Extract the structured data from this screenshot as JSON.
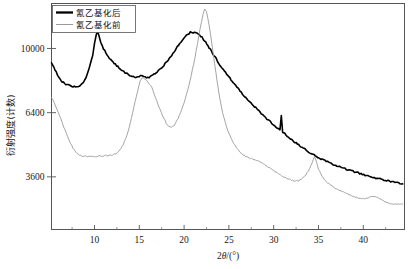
{
  "chart_data": {
    "type": "line",
    "title": "",
    "xlabel": "2θ/(°)",
    "ylabel": "衍射强度(计数)",
    "xlim": [
      5.2,
      44.6
    ],
    "ylim": [
      1900,
      13000
    ],
    "yscale": "sqrt",
    "grid": false,
    "legend_position": "top-left",
    "xticks": [
      10,
      15,
      20,
      25,
      30,
      35,
      40
    ],
    "xtick_labels": [
      "10",
      "15",
      "20",
      "25",
      "30",
      "35",
      "40"
    ],
    "xminorticks": [
      7.5,
      12.5,
      17.5,
      22.5,
      27.5,
      32.5,
      37.5,
      42.5
    ],
    "yticks": [
      10000,
      6400,
      3600
    ],
    "ytick_labels": [
      "10000",
      "6400",
      "3600"
    ],
    "series": [
      {
        "name": "氰乙基化后",
        "color": "#000000",
        "linewidth": 1.6,
        "points": [
          [
            5.2,
            9100
          ],
          [
            5.6,
            8700
          ],
          [
            6.0,
            8300
          ],
          [
            6.4,
            8050
          ],
          [
            6.8,
            7900
          ],
          [
            7.2,
            7820
          ],
          [
            7.6,
            7780
          ],
          [
            8.0,
            7760
          ],
          [
            8.3,
            7800
          ],
          [
            8.6,
            7900
          ],
          [
            8.9,
            8100
          ],
          [
            9.2,
            8450
          ],
          [
            9.5,
            8950
          ],
          [
            9.8,
            9600
          ],
          [
            10.0,
            10300
          ],
          [
            10.2,
            10850
          ],
          [
            10.35,
            11050
          ],
          [
            10.5,
            10800
          ],
          [
            10.7,
            10400
          ],
          [
            11.0,
            10000
          ],
          [
            11.4,
            9620
          ],
          [
            11.8,
            9330
          ],
          [
            12.2,
            9100
          ],
          [
            12.6,
            8900
          ],
          [
            13.0,
            8720
          ],
          [
            13.4,
            8560
          ],
          [
            13.8,
            8420
          ],
          [
            14.2,
            8320
          ],
          [
            14.6,
            8270
          ],
          [
            15.0,
            8290
          ],
          [
            15.25,
            8400
          ],
          [
            15.5,
            8340
          ],
          [
            15.8,
            8270
          ],
          [
            16.1,
            8290
          ],
          [
            16.5,
            8400
          ],
          [
            17.0,
            8600
          ],
          [
            17.5,
            8850
          ],
          [
            18.0,
            9150
          ],
          [
            18.5,
            9500
          ],
          [
            19.0,
            9900
          ],
          [
            19.5,
            10300
          ],
          [
            20.0,
            10650
          ],
          [
            20.4,
            10900
          ],
          [
            20.7,
            11030
          ],
          [
            21.0,
            10980
          ],
          [
            21.3,
            11020
          ],
          [
            21.6,
            10900
          ],
          [
            22.0,
            10700
          ],
          [
            22.4,
            10400
          ],
          [
            22.8,
            10050
          ],
          [
            23.2,
            9700
          ],
          [
            23.6,
            9350
          ],
          [
            24.0,
            9000
          ],
          [
            24.5,
            8650
          ],
          [
            25.0,
            8300
          ],
          [
            25.5,
            7980
          ],
          [
            26.0,
            7680
          ],
          [
            26.5,
            7380
          ],
          [
            27.0,
            7120
          ],
          [
            27.5,
            6880
          ],
          [
            28.0,
            6650
          ],
          [
            28.5,
            6420
          ],
          [
            29.0,
            6200
          ],
          [
            29.5,
            6000
          ],
          [
            30.0,
            5800
          ],
          [
            30.4,
            5650
          ],
          [
            30.7,
            5560
          ],
          [
            30.85,
            6250
          ],
          [
            31.0,
            5480
          ],
          [
            31.4,
            5320
          ],
          [
            31.9,
            5150
          ],
          [
            32.4,
            5000
          ],
          [
            32.9,
            4860
          ],
          [
            33.4,
            4720
          ],
          [
            33.9,
            4600
          ],
          [
            34.4,
            4480
          ],
          [
            34.9,
            4380
          ],
          [
            35.4,
            4280
          ],
          [
            36.0,
            4180
          ],
          [
            36.6,
            4090
          ],
          [
            37.2,
            4000
          ],
          [
            37.8,
            3930
          ],
          [
            38.4,
            3860
          ],
          [
            39.0,
            3790
          ],
          [
            39.6,
            3730
          ],
          [
            40.2,
            3670
          ],
          [
            40.8,
            3610
          ],
          [
            41.4,
            3560
          ],
          [
            42.0,
            3510
          ],
          [
            42.6,
            3460
          ],
          [
            43.2,
            3420
          ],
          [
            43.8,
            3380
          ],
          [
            44.4,
            3340
          ]
        ]
      },
      {
        "name": "氰乙基化前",
        "color": "#9a9a9a",
        "linewidth": 0.9,
        "points": [
          [
            5.2,
            7200
          ],
          [
            5.5,
            6900
          ],
          [
            5.8,
            6600
          ],
          [
            6.1,
            6250
          ],
          [
            6.4,
            5900
          ],
          [
            6.7,
            5560
          ],
          [
            7.0,
            5250
          ],
          [
            7.3,
            4980
          ],
          [
            7.6,
            4760
          ],
          [
            7.9,
            4600
          ],
          [
            8.2,
            4490
          ],
          [
            8.6,
            4430
          ],
          [
            9.0,
            4410
          ],
          [
            9.5,
            4400
          ],
          [
            10.0,
            4400
          ],
          [
            10.5,
            4410
          ],
          [
            11.0,
            4430
          ],
          [
            11.5,
            4450
          ],
          [
            12.0,
            4470
          ],
          [
            12.4,
            4520
          ],
          [
            12.8,
            4650
          ],
          [
            13.2,
            4900
          ],
          [
            13.6,
            5300
          ],
          [
            14.0,
            5900
          ],
          [
            14.4,
            6700
          ],
          [
            14.8,
            7500
          ],
          [
            15.1,
            8050
          ],
          [
            15.3,
            8250
          ],
          [
            15.6,
            8200
          ],
          [
            16.0,
            8000
          ],
          [
            16.4,
            7700
          ],
          [
            16.8,
            7200
          ],
          [
            17.2,
            6700
          ],
          [
            17.6,
            6250
          ],
          [
            18.0,
            5900
          ],
          [
            18.3,
            5720
          ],
          [
            18.6,
            5680
          ],
          [
            18.9,
            5780
          ],
          [
            19.2,
            6000
          ],
          [
            19.6,
            6400
          ],
          [
            20.0,
            6900
          ],
          [
            20.4,
            7550
          ],
          [
            20.8,
            8400
          ],
          [
            21.2,
            9400
          ],
          [
            21.5,
            10300
          ],
          [
            21.8,
            11300
          ],
          [
            22.1,
            12200
          ],
          [
            22.3,
            12650
          ],
          [
            22.5,
            12450
          ],
          [
            22.8,
            11500
          ],
          [
            23.1,
            10300
          ],
          [
            23.4,
            9100
          ],
          [
            23.7,
            8000
          ],
          [
            24.0,
            7100
          ],
          [
            24.3,
            6400
          ],
          [
            24.6,
            5900
          ],
          [
            25.0,
            5400
          ],
          [
            25.4,
            5050
          ],
          [
            25.8,
            4800
          ],
          [
            26.2,
            4600
          ],
          [
            26.6,
            4470
          ],
          [
            27.0,
            4380
          ],
          [
            27.4,
            4320
          ],
          [
            27.8,
            4290
          ],
          [
            28.2,
            4230
          ],
          [
            28.6,
            4150
          ],
          [
            29.0,
            4060
          ],
          [
            29.5,
            3950
          ],
          [
            30.0,
            3840
          ],
          [
            30.5,
            3730
          ],
          [
            31.0,
            3630
          ],
          [
            31.5,
            3540
          ],
          [
            32.0,
            3470
          ],
          [
            32.4,
            3440
          ],
          [
            32.8,
            3460
          ],
          [
            33.2,
            3540
          ],
          [
            33.6,
            3680
          ],
          [
            34.0,
            3900
          ],
          [
            34.3,
            4150
          ],
          [
            34.55,
            4380
          ],
          [
            34.75,
            4200
          ],
          [
            35.0,
            3900
          ],
          [
            35.4,
            3620
          ],
          [
            35.9,
            3420
          ],
          [
            36.4,
            3280
          ],
          [
            36.9,
            3180
          ],
          [
            37.4,
            3100
          ],
          [
            37.9,
            3030
          ],
          [
            38.4,
            2970
          ],
          [
            38.9,
            2910
          ],
          [
            39.4,
            2860
          ],
          [
            39.9,
            2830
          ],
          [
            40.4,
            2840
          ],
          [
            40.8,
            2880
          ],
          [
            41.2,
            2900
          ],
          [
            41.6,
            2870
          ],
          [
            42.0,
            2800
          ],
          [
            42.4,
            2730
          ],
          [
            42.9,
            2680
          ],
          [
            43.4,
            2650
          ],
          [
            43.9,
            2640
          ],
          [
            44.4,
            2660
          ]
        ]
      }
    ]
  },
  "axes": {
    "y_axis_label": "衍射强度(计数)",
    "x_axis_label_prefix": "2",
    "x_axis_label_symbol": "θ",
    "x_axis_label_suffix": "/(°)",
    "ytick_labels": [
      "10000",
      "6400",
      "3600"
    ],
    "xtick_labels": [
      "10",
      "15",
      "20",
      "25",
      "30",
      "35",
      "40"
    ]
  },
  "legend": {
    "entries": [
      {
        "label": "氰乙基化后",
        "color": "#000000",
        "style": "thick"
      },
      {
        "label": "氰乙基化前",
        "color": "#9a9a9a",
        "style": "thin"
      }
    ]
  },
  "colors": {
    "series_after": "#000000",
    "series_before": "#9a9a9a",
    "axis": "#555555",
    "text": "#1a1a1a",
    "background": "#ffffff"
  }
}
